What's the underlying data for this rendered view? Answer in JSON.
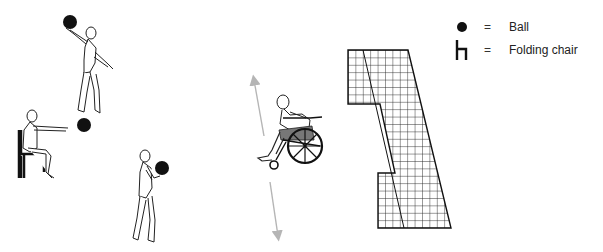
{
  "legend": {
    "items": [
      {
        "symbol": "ball-icon",
        "equals": "=",
        "label": "Ball"
      },
      {
        "symbol": "folding-chair-icon",
        "equals": "=",
        "label": "Folding chair"
      }
    ]
  },
  "figures": [
    {
      "name": "standing-overhead-throw",
      "description": "Standing figure holding ball overhead with right arm"
    },
    {
      "name": "seated-chest-pass",
      "description": "Seated figure on folding chair extending arms toward ball"
    },
    {
      "name": "standing-chest-hold",
      "description": "Standing figure holding ball at chest"
    },
    {
      "name": "wheelchair-user",
      "description": "Wheelchair user with vertical up/down movement arrows"
    },
    {
      "name": "wall-grid",
      "description": "Gridded wall/target shape"
    }
  ],
  "colors": {
    "ink": "#1a1a1a",
    "ball": "#111111",
    "arrow": "#b5b5b5",
    "seat": "#777777"
  }
}
